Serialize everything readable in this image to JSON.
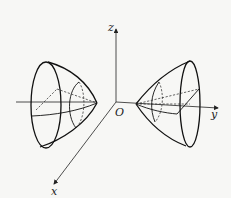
{
  "diagram": {
    "type": "3d-surface",
    "axes": {
      "x_label": "x",
      "y_label": "y",
      "z_label": "z",
      "origin_label": "O"
    },
    "sheets": [
      "left-sheet",
      "right-sheet"
    ]
  }
}
